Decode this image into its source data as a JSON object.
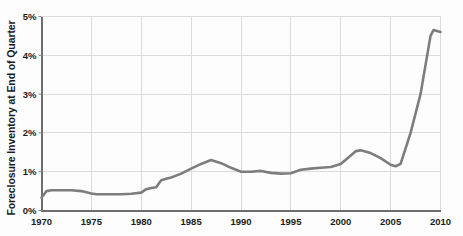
{
  "chart_data": {
    "type": "line",
    "title": "",
    "subtitle": "",
    "xlabel": "",
    "ylabel": "Foreclosure Inventory at End of Quarter",
    "xlim": [
      1970,
      2010
    ],
    "ylim": [
      0,
      5
    ],
    "grid": true,
    "legend": null,
    "legend_position": "none",
    "y_tick_labels": [
      "0%",
      "1%",
      "2%",
      "3%",
      "4%",
      "5%"
    ],
    "y_tick_values": [
      0,
      1,
      2,
      3,
      4,
      5
    ],
    "x_tick_labels": [
      "1970",
      "1975",
      "1980",
      "1985",
      "1990",
      "1995",
      "2000",
      "2005",
      "2010"
    ],
    "x_tick_values": [
      1970,
      1975,
      1980,
      1985,
      1990,
      1995,
      2000,
      2005,
      2010
    ],
    "y_unit": "percent",
    "series": [
      {
        "name": "Foreclosure Inventory",
        "color": "#7d7d7d",
        "x": [
          1970,
          1970.5,
          1971,
          1972,
          1973,
          1974,
          1975,
          1975.5,
          1976,
          1977,
          1978,
          1979,
          1980,
          1980.5,
          1981,
          1981.5,
          1982,
          1982.5,
          1983,
          1984,
          1985,
          1986,
          1987,
          1988,
          1989,
          1990,
          1991,
          1992,
          1993,
          1994,
          1995,
          1996,
          1997,
          1998,
          1999,
          2000,
          2001,
          2001.5,
          2002,
          2003,
          2004,
          2005,
          2005.5,
          2006,
          2007,
          2008,
          2009,
          2009.3,
          2010
        ],
        "y": [
          0.33,
          0.5,
          0.52,
          0.52,
          0.52,
          0.5,
          0.44,
          0.42,
          0.42,
          0.42,
          0.42,
          0.43,
          0.46,
          0.55,
          0.58,
          0.6,
          0.78,
          0.82,
          0.85,
          0.95,
          1.08,
          1.2,
          1.3,
          1.22,
          1.1,
          1.0,
          1.0,
          1.02,
          0.97,
          0.95,
          0.96,
          1.05,
          1.08,
          1.1,
          1.12,
          1.2,
          1.42,
          1.53,
          1.55,
          1.48,
          1.35,
          1.18,
          1.14,
          1.2,
          2.0,
          3.0,
          4.5,
          4.65,
          4.6
        ]
      }
    ]
  },
  "axis": {
    "y_label_text": "Foreclosure Inventory at End of Quarter"
  }
}
